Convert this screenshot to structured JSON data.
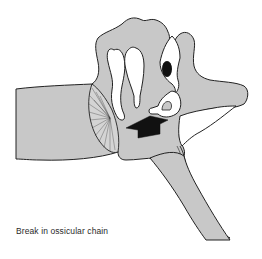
{
  "figure": {
    "caption": "Break in ossicular chain",
    "colors": {
      "tissue_fill": "#c8c8c8",
      "outline": "#222222",
      "bone_fill": "#ffffff",
      "arrow_fill": "#111111",
      "background": "#ffffff"
    },
    "parts": [
      {
        "name": "ear-canal",
        "label": ""
      },
      {
        "name": "eardrum",
        "label": ""
      },
      {
        "name": "malleus",
        "label": ""
      },
      {
        "name": "incus",
        "label": ""
      },
      {
        "name": "stapes",
        "label": ""
      },
      {
        "name": "oval-window",
        "label": ""
      },
      {
        "name": "eustachian-tube",
        "label": ""
      },
      {
        "name": "break-arrow",
        "label": ""
      }
    ]
  }
}
